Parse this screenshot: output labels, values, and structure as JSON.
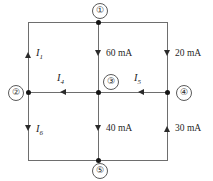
{
  "diagram": {
    "wire_color": "#6e6e6e",
    "dot_color": "#151515",
    "text_color": "#1f1f1f"
  },
  "nodes": [
    {
      "id": "node-1",
      "label": "①"
    },
    {
      "id": "node-2",
      "label": "②"
    },
    {
      "id": "node-3",
      "label": "③"
    },
    {
      "id": "node-4",
      "label": "④"
    },
    {
      "id": "node-5",
      "label": "⑤"
    }
  ],
  "currents": [
    {
      "id": "i1",
      "symbol": "I",
      "subscript": "1",
      "text": "I₁",
      "direction": "up"
    },
    {
      "id": "i4",
      "symbol": "I",
      "subscript": "4",
      "text": "I₄",
      "direction": "left"
    },
    {
      "id": "i5",
      "symbol": "I",
      "subscript": "5",
      "text": "I₅",
      "direction": "left"
    },
    {
      "id": "i6",
      "symbol": "I",
      "subscript": "6",
      "text": "I₆",
      "direction": "down"
    }
  ],
  "measured": [
    {
      "id": "center-top",
      "value": "60 mA",
      "direction": "down"
    },
    {
      "id": "right-top",
      "value": "20 mA",
      "direction": "down"
    },
    {
      "id": "center-bottom",
      "value": "40 mA",
      "direction": "down"
    },
    {
      "id": "right-bottom",
      "value": "30 mA",
      "direction": "up"
    }
  ],
  "subscripts": {
    "one": "1",
    "four": "4",
    "five": "5",
    "six": "6"
  },
  "symbols": {
    "i": "I"
  }
}
